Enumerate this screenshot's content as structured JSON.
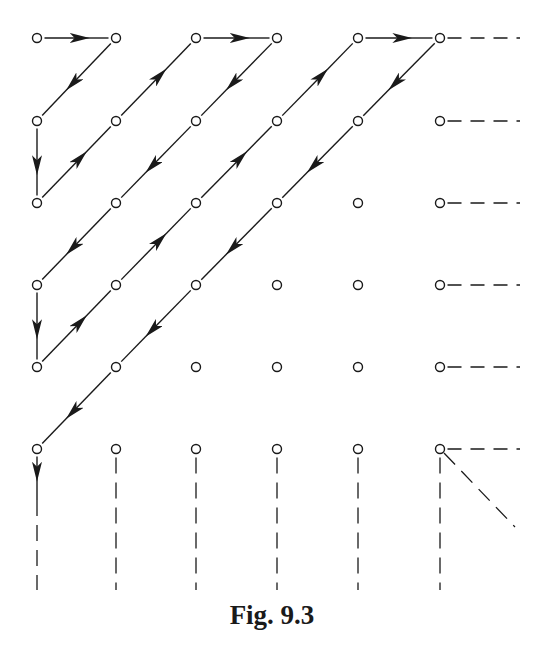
{
  "figure": {
    "caption": "Fig. 9.3",
    "colors": {
      "stroke": "#1a1a1a",
      "background": "#ffffff"
    },
    "grid": {
      "cols_x": [
        37,
        116,
        196,
        277,
        358,
        440
      ],
      "rows_y": [
        38,
        121,
        203,
        285,
        367,
        449
      ],
      "node_radius": 4.5
    },
    "path_order": [
      [
        0,
        0
      ],
      [
        1,
        0
      ],
      [
        0,
        1
      ],
      [
        0,
        2
      ],
      [
        1,
        1
      ],
      [
        2,
        0
      ],
      [
        3,
        0
      ],
      [
        2,
        1
      ],
      [
        1,
        2
      ],
      [
        0,
        3
      ],
      [
        0,
        4
      ],
      [
        1,
        3
      ],
      [
        2,
        2
      ],
      [
        3,
        1
      ],
      [
        4,
        0
      ],
      [
        5,
        0
      ],
      [
        4,
        1
      ],
      [
        3,
        2
      ],
      [
        2,
        3
      ],
      [
        1,
        4
      ],
      [
        0,
        5
      ],
      [
        0,
        6
      ]
    ],
    "continuation": {
      "horizontal_dashes_from_last_column_rows": [
        0,
        1,
        2,
        3,
        4,
        5
      ],
      "vertical_dashes_from_last_row_cols": [
        0,
        1,
        2,
        3,
        4,
        5
      ],
      "diagonal_dash_from": [
        5,
        5
      ]
    }
  }
}
